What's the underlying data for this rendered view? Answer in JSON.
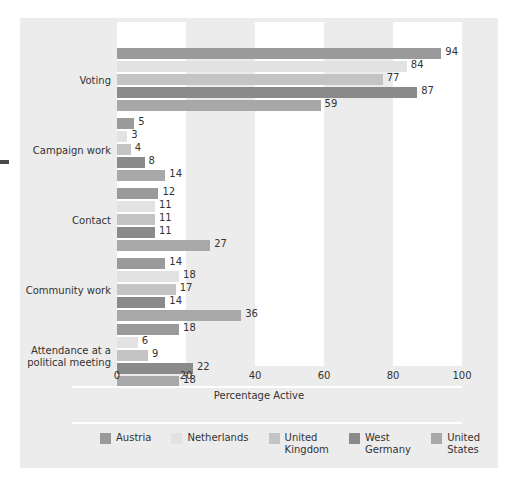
{
  "chart_data": {
    "type": "bar",
    "orientation": "horizontal",
    "title": "",
    "xlabel": "Percentage Active",
    "ylabel": "",
    "xlim": [
      0,
      100
    ],
    "xticks": [
      0,
      20,
      40,
      60,
      80,
      100
    ],
    "grid": "alternating vertical white bands at 0-20, 40-60, 80-100",
    "legend_position": "bottom",
    "categories": [
      "Voting",
      "Campaign work",
      "Contact",
      "Community work",
      "Attendance at a\npolitical meeting"
    ],
    "series": [
      {
        "name": "Austria",
        "color": "#9a9a9a",
        "values": [
          94,
          5,
          12,
          14,
          18
        ]
      },
      {
        "name": "Netherlands",
        "color": "#e2e2e2",
        "values": [
          84,
          3,
          11,
          18,
          6
        ]
      },
      {
        "name": "United\nKingdom",
        "color": "#c4c4c4",
        "values": [
          77,
          4,
          11,
          17,
          9
        ]
      },
      {
        "name": "West\nGermany",
        "color": "#8a8a8a",
        "values": [
          87,
          8,
          11,
          14,
          22
        ]
      },
      {
        "name": "United\nStates",
        "color": "#a8a8a8",
        "values": [
          59,
          14,
          27,
          36,
          18
        ]
      }
    ]
  },
  "axis": {
    "tick_labels": [
      "0",
      "20",
      "40",
      "60",
      "80",
      "100"
    ],
    "title": "Percentage Active"
  },
  "legend": {
    "items": [
      {
        "label": "Austria"
      },
      {
        "label": "Netherlands"
      },
      {
        "label": "United\nKingdom"
      },
      {
        "label": "West\nGermany"
      },
      {
        "label": "United\nStates"
      }
    ]
  },
  "colors": {
    "panel_background": "#ececec",
    "band": "#ffffff",
    "text": "#333333"
  }
}
